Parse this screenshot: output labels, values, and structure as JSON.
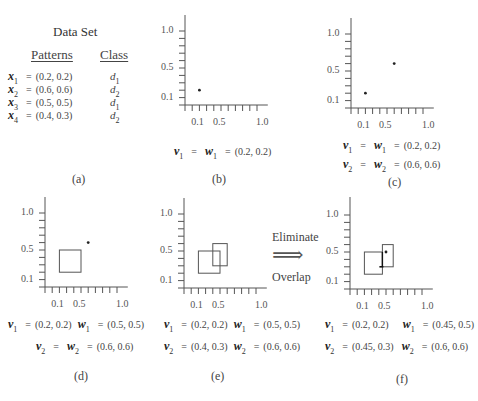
{
  "panel_a": {
    "title": "Data Set",
    "headers": {
      "patterns": "Patterns",
      "class": "Class"
    },
    "rows": [
      {
        "var": "x",
        "sub": "1",
        "eq": "=",
        "value": "(0.2, 0.2)",
        "cls": "d",
        "cls_sub": "1"
      },
      {
        "var": "x",
        "sub": "2",
        "eq": "=",
        "value": "(0.6, 0.6)",
        "cls": "d",
        "cls_sub": "2"
      },
      {
        "var": "x",
        "sub": "3",
        "eq": "=",
        "value": "(0.5, 0.5)",
        "cls": "d",
        "cls_sub": "1"
      },
      {
        "var": "x",
        "sub": "4",
        "eq": "=",
        "value": "(0.4, 0.3)",
        "cls": "d",
        "cls_sub": "2"
      }
    ],
    "caption": "(a)"
  },
  "axis": {
    "y_ticks_labels": [
      "1.0",
      "0.5",
      "0.1"
    ],
    "x_ticks_labels": [
      "0.1",
      "0.5",
      "1.0"
    ]
  },
  "panel_b": {
    "caption": "(b)",
    "lines": [
      {
        "v": "v",
        "v_sub": "1",
        "eq1": "=",
        "w": "w",
        "w_sub": "1",
        "eq2": "=",
        "value": "(0.2, 0.2)"
      }
    ]
  },
  "panel_c": {
    "caption": "(c)",
    "lines": [
      {
        "v": "v",
        "v_sub": "1",
        "eq1": "=",
        "w": "w",
        "w_sub": "1",
        "eq2": "=",
        "value": "(0.2, 0.2)"
      },
      {
        "v": "v",
        "v_sub": "2",
        "eq1": "=",
        "w": "w",
        "w_sub": "2",
        "eq2": "=",
        "value": "(0.6, 0.6)"
      }
    ]
  },
  "panel_d": {
    "caption": "(d)",
    "line1": {
      "v": "v",
      "v_sub": "1",
      "eq1": "=",
      "v_value": "(0.2, 0.2)",
      "w": "w",
      "w_sub": "1",
      "eq2": "=",
      "w_value": "(0.5, 0.5)"
    },
    "line2": {
      "v": "v",
      "v_sub": "2",
      "eq1": "=",
      "w": "w",
      "w_sub": "2",
      "eq2": "=",
      "value": "(0.6, 0.6)"
    }
  },
  "panel_e": {
    "caption": "(e)",
    "line1": {
      "v": "v",
      "v_sub": "1",
      "eq1": "=",
      "v_value": "(0.2, 0.2)",
      "w": "w",
      "w_sub": "1",
      "eq2": "=",
      "w_value": "(0.5, 0.5)"
    },
    "line2": {
      "v": "v",
      "v_sub": "2",
      "eq1": "=",
      "v_value": "(0.4, 0.3)",
      "w": "w",
      "w_sub": "2",
      "eq2": "=",
      "w_value": "(0.6, 0.6)"
    }
  },
  "transition": {
    "top": "Eliminate",
    "arrow": "⟹",
    "bottom": "Overlap"
  },
  "panel_f": {
    "caption": "(f)",
    "line1": {
      "v": "v",
      "v_sub": "1",
      "eq1": "=",
      "v_value": "(0.2, 0.2)",
      "w": "w",
      "w_sub": "1",
      "eq2": "=",
      "w_value": "(0.45, 0.5)"
    },
    "line2": {
      "v": "v",
      "v_sub": "2",
      "eq1": "=",
      "v_value": "(0.45, 0.3)",
      "w": "w",
      "w_sub": "2",
      "eq2": "=",
      "w_value": "(0.6, 0.6)"
    }
  },
  "chart_data": [
    {
      "panel": "b",
      "type": "scatter",
      "xlim": [
        0,
        1.0
      ],
      "ylim": [
        0,
        1.0
      ],
      "points": [
        [
          0.2,
          0.2
        ]
      ],
      "boxes": []
    },
    {
      "panel": "c",
      "type": "scatter",
      "xlim": [
        0,
        1.0
      ],
      "ylim": [
        0,
        1.0
      ],
      "points": [
        [
          0.2,
          0.2
        ],
        [
          0.6,
          0.6
        ]
      ],
      "boxes": []
    },
    {
      "panel": "d",
      "type": "scatter",
      "xlim": [
        0,
        1.0
      ],
      "ylim": [
        0,
        1.0
      ],
      "points": [
        [
          0.6,
          0.6
        ]
      ],
      "boxes": [
        {
          "v": [
            0.2,
            0.2
          ],
          "w": [
            0.5,
            0.5
          ]
        }
      ]
    },
    {
      "panel": "e",
      "type": "scatter",
      "xlim": [
        0,
        1.0
      ],
      "ylim": [
        0,
        1.0
      ],
      "points": [],
      "boxes": [
        {
          "v": [
            0.2,
            0.2
          ],
          "w": [
            0.5,
            0.5
          ]
        },
        {
          "v": [
            0.4,
            0.3
          ],
          "w": [
            0.6,
            0.6
          ]
        }
      ]
    },
    {
      "panel": "f",
      "type": "scatter",
      "xlim": [
        0,
        1.0
      ],
      "ylim": [
        0,
        1.0
      ],
      "points": [
        [
          0.5,
          0.5
        ]
      ],
      "boxes": [
        {
          "v": [
            0.2,
            0.2
          ],
          "w": [
            0.45,
            0.5
          ]
        },
        {
          "v": [
            0.45,
            0.3
          ],
          "w": [
            0.6,
            0.6
          ]
        }
      ]
    }
  ]
}
